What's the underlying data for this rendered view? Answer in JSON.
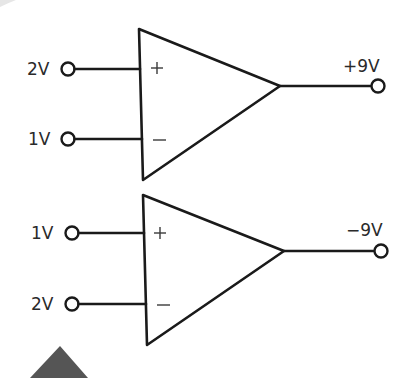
{
  "diagram": {
    "type": "op-amp comparator illustration",
    "colors": {
      "line": "#1a1a1a",
      "text": "#2a2a2a",
      "background": "#ffffff",
      "marker": "#555555"
    },
    "opamps": [
      {
        "id": "top",
        "noninverting_input": {
          "sign": "+",
          "label": "2V"
        },
        "inverting_input": {
          "sign": "−",
          "label": "1V"
        },
        "output": {
          "label": "+9V"
        }
      },
      {
        "id": "bottom",
        "noninverting_input": {
          "sign": "+",
          "label": "1V"
        },
        "inverting_input": {
          "sign": "−",
          "label": "2V"
        },
        "output": {
          "label": "−9V"
        }
      }
    ]
  }
}
